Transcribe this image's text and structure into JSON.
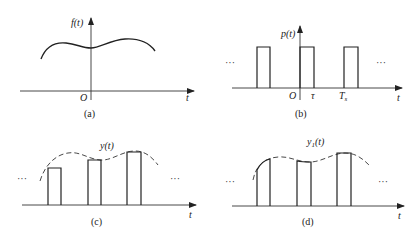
{
  "panels": {
    "a": {
      "caption": "(a)",
      "y_label": "f(t)",
      "origin_label": "O",
      "x_label": "t",
      "description": "continuous signal f(t)"
    },
    "b": {
      "caption": "(b)",
      "y_label": "p(t)",
      "origin_label": "O",
      "tau_label": "τ",
      "period_label": "T",
      "period_sub": "s",
      "x_label": "t",
      "ellipsis_left": "···",
      "ellipsis_right": "···",
      "description": "rectangular pulse train"
    },
    "c": {
      "caption": "(c)",
      "curve_label": "y(t)",
      "x_label": "t",
      "ellipsis_left": "···",
      "ellipsis_right": "···",
      "description": "natural sampling - flat top pulses"
    },
    "d": {
      "caption": "(d)",
      "curve_label_main": "y",
      "curve_label_sub": "1",
      "curve_label_arg": "(t)",
      "x_label": "t",
      "ellipsis_left": "···",
      "ellipsis_right": "···",
      "description": "natural sampling - curved top pulses"
    }
  },
  "colors": {
    "line": "#222222",
    "background": "#ffffff"
  }
}
